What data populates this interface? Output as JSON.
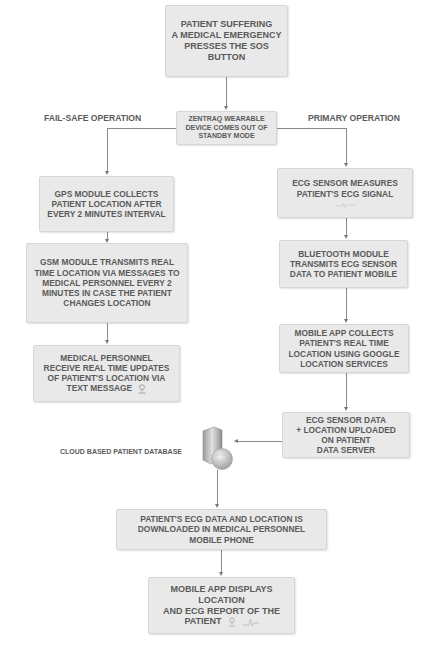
{
  "diagram": {
    "start": {
      "lines": [
        "PATIENT SUFFERING",
        "A MEDICAL EMERGENCY",
        "PRESSES THE SOS",
        "BUTTON"
      ]
    },
    "device_wake": {
      "lines": [
        "ZENTRAQ WEARABLE",
        "DEVICE COMES OUT OF",
        "STANDBY MODE"
      ]
    },
    "branch_labels": {
      "left": "FAIL-SAFE OPERATION",
      "right": "PRIMARY OPERATION"
    },
    "failsafe": [
      {
        "lines": [
          "GPS MODULE COLLECTS",
          "PATIENT LOCATION AFTER",
          "EVERY 2 MINUTES INTERVAL"
        ]
      },
      {
        "lines": [
          "GSM MODULE TRANSMITS REAL",
          "TIME LOCATION VIA MESSAGES TO",
          "MEDICAL PERSONNEL EVERY 2",
          "MINUTES IN CASE THE PATIENT",
          "CHANGES LOCATION"
        ]
      },
      {
        "lines": [
          "MEDICAL PERSONNEL",
          "RECEIVE REAL TIME UPDATES",
          "OF PATIENT'S LOCATION VIA",
          "TEXT MESSAGE"
        ],
        "icon": "location-pin-icon"
      }
    ],
    "primary": [
      {
        "lines": [
          "ECG SENSOR MEASURES",
          "PATIENT'S ECG SIGNAL"
        ],
        "icon": "ecg-wave-icon"
      },
      {
        "lines": [
          "BLUETOOTH MODULE",
          "TRANSMITS ECG SENSOR",
          "DATA TO PATIENT MOBILE"
        ]
      },
      {
        "lines": [
          "MOBILE APP COLLECTS",
          "PATIENT'S REAL TIME",
          "LOCATION USING GOOGLE",
          "LOCATION SERVICES"
        ]
      },
      {
        "lines": [
          "ECG SENSOR DATA",
          "+ LOCATION UPLOADED",
          "ON PATIENT",
          "DATA SERVER"
        ]
      }
    ],
    "database": {
      "label": "CLOUD BASED PATIENT DATABASE",
      "icon": "cloud-server-icon"
    },
    "download": {
      "lines": [
        "PATIENT'S ECG DATA AND LOCATION IS",
        "DOWNLOADED IN MEDICAL PERSONNEL",
        "MOBILE PHONE"
      ]
    },
    "final": {
      "lines": [
        "MOBILE APP DISPLAYS",
        "LOCATION",
        "AND ECG REPORT OF THE",
        "PATIENT"
      ],
      "icons": [
        "location-pin-icon",
        "ecg-wave-icon"
      ]
    },
    "colors": {
      "box_fill": "#e9e9e9",
      "box_border": "#d6d6d6",
      "text": "#5a5a5a",
      "connector": "#8a8a8a"
    }
  }
}
